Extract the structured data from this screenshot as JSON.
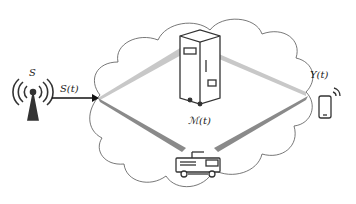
{
  "diagram": {
    "source": {
      "label": "S",
      "icon": "radio-tower-icon"
    },
    "signal_in": {
      "label": "S(t)"
    },
    "channel": {
      "label": "ℳ(t)",
      "icon": "server-cabinet-icon"
    },
    "relay": {
      "icon": "fire-truck-icon"
    },
    "output": {
      "label": "Y(t)",
      "icon": "smartphone-icon"
    },
    "colors": {
      "stroke": "#333333",
      "beam_light": "#c8c8c8",
      "beam_dark": "#8a8a8a",
      "cloud": "#555555"
    }
  }
}
